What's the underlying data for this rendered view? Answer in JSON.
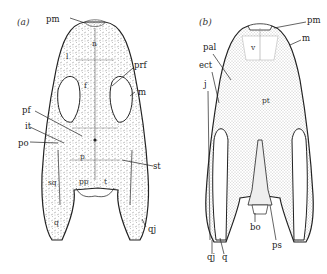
{
  "figure": {
    "panels": [
      {
        "tag": "(a)",
        "view": "dorsal skull",
        "labels": {
          "pm": "pm",
          "n": "n",
          "l": "l",
          "prf": "prf",
          "m": "m",
          "f": "f",
          "pf": "pf",
          "it": "it",
          "po": "po",
          "p": "p",
          "st": "st",
          "sq": "sq",
          "pp": "pp",
          "t": "t",
          "q": "q",
          "qj": "qj"
        }
      },
      {
        "tag": "(b)",
        "view": "ventral (palatal) skull",
        "labels": {
          "pm": "pm",
          "m": "m",
          "v": "v",
          "pal": "pal",
          "ect": "ect",
          "j": "j",
          "pt": "pt",
          "qj": "qj",
          "q": "q",
          "bo": "bo",
          "ps": "ps"
        }
      }
    ],
    "colors": {
      "ink": "#222222",
      "stipple": "#8a8a8a",
      "background": "#ffffff"
    }
  }
}
